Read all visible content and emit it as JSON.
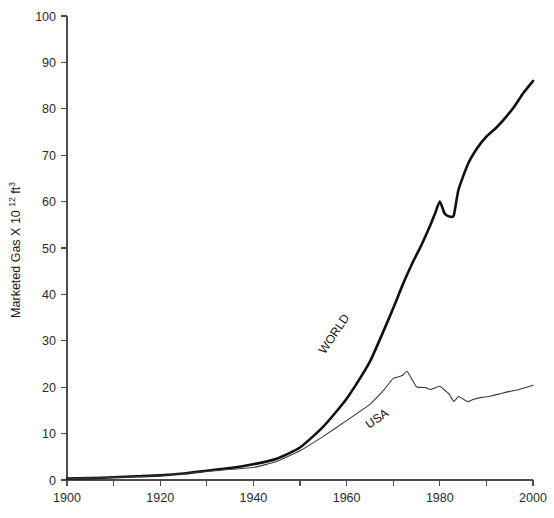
{
  "chart_data": {
    "type": "line",
    "title": "",
    "xlabel": "",
    "ylabel": "Marketed Gas X 10",
    "ylabel_sup": "12",
    "ylabel_unit": "ft",
    "ylabel_unit_sup": "3",
    "ylabel_full": "Marketed Gas X 10¹² ft³",
    "xlim": [
      1900,
      2000
    ],
    "ylim": [
      0,
      100
    ],
    "grid": false,
    "legend": "inline-curve-labels",
    "x_major_ticks": [
      1900,
      1920,
      1940,
      1960,
      1980,
      2000
    ],
    "x_minor_ticks": [
      1910,
      1930,
      1950,
      1970,
      1990
    ],
    "x_tick_labels": [
      "1900",
      "1920",
      "1940",
      "1960",
      "1980",
      "2000"
    ],
    "y_major_ticks": [
      0,
      10,
      20,
      30,
      40,
      50,
      60,
      70,
      80,
      90,
      100
    ],
    "y_tick_labels": [
      "0",
      "10",
      "20",
      "30",
      "40",
      "50",
      "60",
      "70",
      "80",
      "90",
      "100"
    ],
    "series": [
      {
        "name": "WORLD",
        "label": "WORLD",
        "color": "#111111",
        "linewidth": 2.6,
        "label_x": 1958,
        "label_y": 31,
        "label_rotation": -56,
        "x": [
          1900,
          1905,
          1910,
          1915,
          1920,
          1925,
          1930,
          1935,
          1940,
          1945,
          1950,
          1955,
          1960,
          1965,
          1970,
          1972,
          1974,
          1976,
          1978,
          1979,
          1980,
          1981,
          1982,
          1983,
          1984,
          1986,
          1988,
          1990,
          1992,
          1994,
          1996,
          1998,
          2000
        ],
        "y": [
          0.3,
          0.4,
          0.6,
          0.8,
          1.0,
          1.4,
          2.0,
          2.6,
          3.4,
          4.6,
          7.0,
          11.5,
          17.5,
          25.5,
          37.0,
          42.0,
          46.5,
          50.5,
          55.0,
          57.5,
          60.0,
          57.5,
          56.8,
          57.0,
          62.5,
          68.0,
          71.5,
          74.0,
          75.8,
          78.0,
          80.5,
          83.5,
          86.0
        ]
      },
      {
        "name": "USA",
        "label": "USA",
        "color": "#3a3a3a",
        "linewidth": 1.1,
        "label_x": 1967,
        "label_y": 12.5,
        "label_rotation": -34,
        "x": [
          1900,
          1910,
          1920,
          1930,
          1940,
          1945,
          1950,
          1955,
          1960,
          1965,
          1968,
          1970,
          1972,
          1973,
          1975,
          1977,
          1978,
          1980,
          1982,
          1983,
          1984,
          1986,
          1987,
          1989,
          1991,
          1993,
          1995,
          1997,
          2000
        ],
        "y": [
          0.25,
          0.55,
          0.9,
          1.9,
          2.7,
          4.0,
          6.3,
          9.4,
          12.8,
          16.3,
          19.4,
          21.9,
          22.5,
          23.4,
          20.1,
          19.9,
          19.5,
          20.2,
          18.5,
          16.9,
          18.0,
          16.9,
          17.3,
          17.8,
          18.1,
          18.6,
          19.1,
          19.5,
          20.4
        ]
      }
    ]
  }
}
